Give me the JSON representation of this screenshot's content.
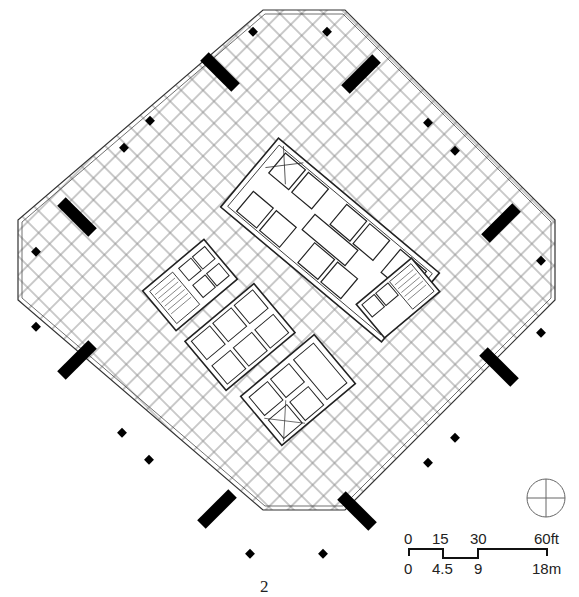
{
  "figure": {
    "number": "2",
    "type": "floor-plan"
  },
  "colors": {
    "line": "#333333",
    "grid": "#8a8a8a",
    "column": "#000000",
    "background": "#ffffff"
  },
  "north_arrow": {
    "symbol": "circle-crosshair"
  },
  "scale_bar": {
    "feet_labels": [
      "0",
      "15",
      "30",
      "60ft"
    ],
    "meter_labels": [
      "0",
      "4.5",
      "9",
      "18m"
    ]
  }
}
